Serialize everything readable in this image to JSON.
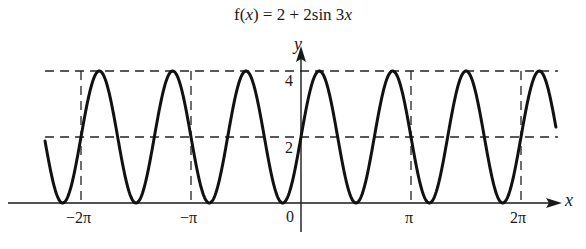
{
  "chart_data": {
    "type": "line",
    "title": "f(x) = 2 + 2sin 3x",
    "function": "2 + 2*sin(3*x)",
    "xlabel": "x",
    "ylabel": "y",
    "xlim": [
      -7.31,
      7.28
    ],
    "ylim": [
      0,
      4
    ],
    "x_ticks": [
      {
        "value": -6.2832,
        "label": "−2π"
      },
      {
        "value": -3.1416,
        "label": "−π"
      },
      {
        "value": 0,
        "label": "0"
      },
      {
        "value": 3.1416,
        "label": "π"
      },
      {
        "value": 6.2832,
        "label": "2π"
      }
    ],
    "y_ticks": [
      {
        "value": 2,
        "label": "2"
      },
      {
        "value": 4,
        "label": "4"
      }
    ],
    "reference_lines": {
      "horizontal_dashed": [
        2,
        4
      ],
      "vertical_dashed": [
        -6.2832,
        -3.1416,
        3.1416,
        6.2832
      ]
    },
    "series": [
      {
        "name": "f(x) = 2 + 2sin 3x",
        "color": "#111111",
        "amplitude": 2,
        "midline": 2,
        "period": 2.0944,
        "max": 4,
        "min": 0
      }
    ],
    "grid": false,
    "legend": null
  },
  "labels": {
    "title_prefix": "f(",
    "title_var": "x",
    "title_suffix": ") = 2 + 2sin 3",
    "title_var2": "x",
    "x_axis": "x",
    "y_axis": "y",
    "y4": "4",
    "y2": "2",
    "origin": "0",
    "neg2pi": "−2π",
    "negpi": "−π",
    "pi": "π",
    "twopi": "2π"
  },
  "colors": {
    "curve": "#111111",
    "axes": "#1a1a1a",
    "dashes": "#222222",
    "background": "#ffffff"
  }
}
